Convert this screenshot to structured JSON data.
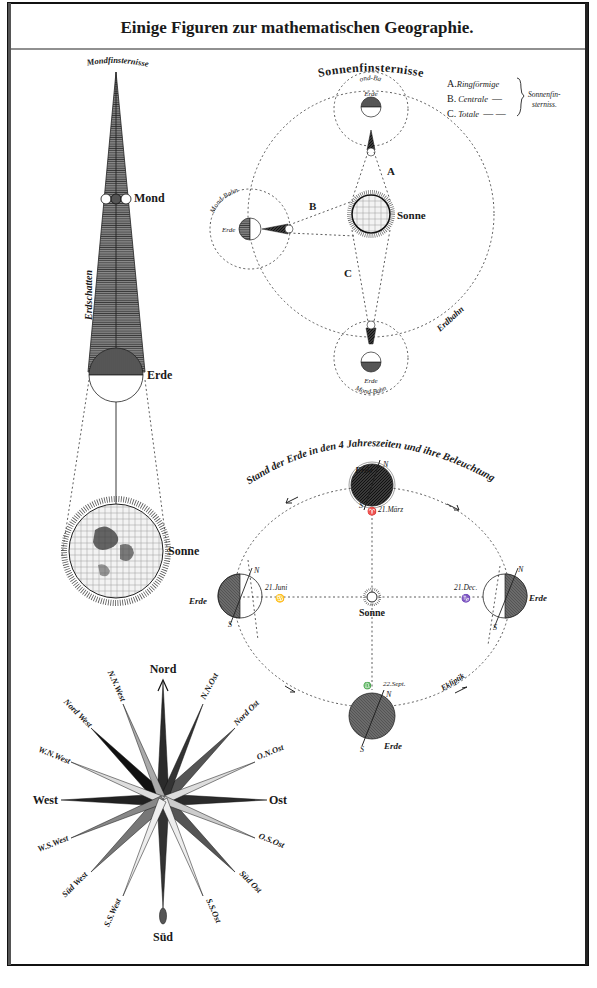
{
  "plate": {
    "title": "Einige Figuren zur mathematischen Geographie."
  },
  "lunar_eclipse": {
    "heading": "Mondfinsternisse",
    "shadow_label": "Erdschatten",
    "moon_label": "Mond",
    "earth_label": "Erde",
    "sun_label": "Sonne"
  },
  "solar_eclipse": {
    "heading": "Sonnenfinsternisse",
    "moon_orbit_label": "Mond-Bahn",
    "earth_label": "Erde",
    "sun_label": "Sonne",
    "earth_orbit_label": "Erdbahn",
    "marker_a": "A",
    "marker_b": "B",
    "marker_c": "C",
    "legend": {
      "items": [
        {
          "key": "A.",
          "text": "Ringförmige",
          "line": ""
        },
        {
          "key": "B.",
          "text": "Centrale",
          "line": "—"
        },
        {
          "key": "C.",
          "text": "Totale",
          "line": "— —"
        }
      ],
      "group_label_1": "Sonnenfin-",
      "group_label_2": "sterniss."
    }
  },
  "seasons": {
    "heading": "Stand der Erde in den 4 Jahreszeiten und ihre Beleuchtung",
    "earth_label": "Erde",
    "sun_label": "Sonne",
    "ecliptic_label": "Ekliptik",
    "north": "N",
    "south": "S",
    "dates": {
      "march": "21.März",
      "june": "21.Juni",
      "september": "22.Sept.",
      "december": "21.Dec."
    },
    "symbols": {
      "march": "♈",
      "june": "♋",
      "september": "♎",
      "december": "♑"
    }
  },
  "compass_rose": {
    "north": "Nord",
    "south": "Süd",
    "east": "Ost",
    "west": "West",
    "nne": "N.N.Ost",
    "ne": "Nord Ost",
    "ene": "O.N.Ost",
    "ese": "O.S.Ost",
    "se": "Süd Ost",
    "sse": "S.S.Ost",
    "ssw": "S.S.West",
    "sw": "Süd West",
    "wsw": "W.S.West",
    "wnw": "W.N.West",
    "nw": "Nord West",
    "nnw": "N.N.West"
  }
}
